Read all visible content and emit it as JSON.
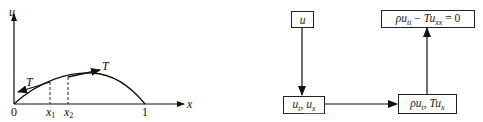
{
  "left_figure": {
    "axis_labels": {
      "y": "u",
      "x": "x"
    },
    "tick_labels": {
      "origin": "0",
      "x1": "x",
      "x1_sub": "1",
      "x2": "x",
      "x2_sub": "2",
      "end": "1"
    },
    "tension_labels": {
      "left": "T",
      "right": "T"
    },
    "stroke_color": "#111111"
  },
  "right_figure": {
    "boxes": {
      "displacement": {
        "main": "u"
      },
      "derivatives": {
        "a": "u",
        "a_sub": "t",
        "sep": ", ",
        "b": "u",
        "b_sub": "x"
      },
      "momentum_force": {
        "a": "ρu",
        "a_sub": "t",
        "sep": ", ",
        "b": "Tu",
        "b_sub": "x"
      },
      "equation": {
        "a": "ρu",
        "a_sub": "tt",
        "op": " − ",
        "b": "Tu",
        "b_sub": "xx",
        "rhs": " = 0"
      }
    },
    "arrows": [
      {
        "from": "displacement",
        "to": "derivatives",
        "direction": "down"
      },
      {
        "from": "derivatives",
        "to": "momentum_force",
        "direction": "right"
      },
      {
        "from": "momentum_force",
        "to": "equation",
        "direction": "up"
      }
    ],
    "accent_underline_color": "#c0392b"
  }
}
